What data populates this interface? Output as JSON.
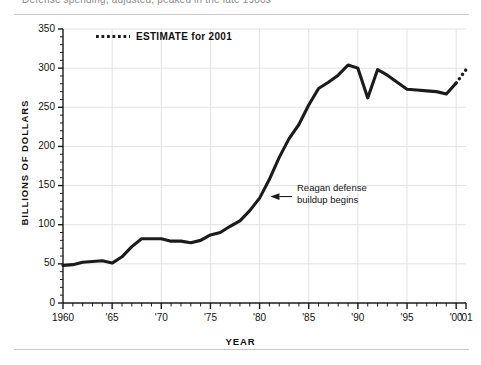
{
  "figure": {
    "clipped_header": "Defense spending, adjusted, peaked in the late 1980s",
    "legend": {
      "marker": "dotted-line-swatch",
      "label": "ESTIMATE for 2001"
    },
    "annotation": {
      "line1": "Reagan defense",
      "line2": "buildup begins",
      "marker": "left-arrow-icon"
    },
    "colors": {
      "line": "#1b1b1b",
      "grid": "#e2e2e2",
      "axis": "#1b1b1b",
      "rule": "#c9c9c9",
      "background": "#ffffff"
    }
  },
  "chart_data": {
    "type": "line",
    "title": "",
    "xlabel": "YEAR",
    "ylabel": "BILLIONS OF DOLLARS",
    "xlim": [
      1960,
      2001
    ],
    "ylim": [
      0,
      350
    ],
    "grid": "both-major",
    "legend_position": "top-left-inside",
    "y_ticks": [
      0,
      50,
      100,
      150,
      200,
      250,
      300,
      350
    ],
    "y_tick_labels": [
      "0",
      "50",
      "100",
      "150",
      "200",
      "250",
      "300",
      "350"
    ],
    "y_minor_tick_step": 10,
    "x_ticks": [
      1960,
      1965,
      1970,
      1975,
      1980,
      1985,
      1990,
      1995,
      2000,
      2001
    ],
    "x_tick_labels": [
      "1960",
      "'65",
      "'70",
      "'75",
      "'80",
      "'85",
      "'90",
      "'95",
      "'00",
      "'01"
    ],
    "x_minor_tick_step": 1,
    "series": [
      {
        "name": "Defense spending",
        "style": "solid",
        "x": [
          1960,
          1961,
          1962,
          1963,
          1964,
          1965,
          1966,
          1967,
          1968,
          1969,
          1970,
          1971,
          1972,
          1973,
          1974,
          1975,
          1976,
          1977,
          1978,
          1979,
          1980,
          1981,
          1982,
          1983,
          1984,
          1985,
          1986,
          1987,
          1988,
          1989,
          1990,
          1991,
          1992,
          1993,
          1994,
          1995,
          1996,
          1997,
          1998,
          1999,
          2000
        ],
        "values": [
          48,
          49,
          52,
          53,
          54,
          51,
          59,
          72,
          82,
          82,
          82,
          79,
          79,
          77,
          80,
          87,
          90,
          98,
          105,
          118,
          134,
          158,
          186,
          210,
          228,
          253,
          274,
          282,
          291,
          304,
          300,
          262,
          298,
          291,
          282,
          273,
          272,
          271,
          270,
          267,
          281
        ]
      },
      {
        "name": "ESTIMATE for 2001",
        "style": "dotted",
        "x": [
          2000,
          2001
        ],
        "values": [
          281,
          298
        ]
      }
    ],
    "annotations": [
      {
        "text": "Reagan defense buildup begins",
        "point_x": 1981,
        "point_y": 136
      }
    ]
  }
}
